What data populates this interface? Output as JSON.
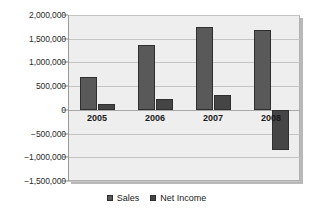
{
  "chart_data": {
    "type": "bar",
    "title": "",
    "xlabel": "",
    "ylabel": "",
    "categories": [
      "2005",
      "2006",
      "2007",
      "2008"
    ],
    "series": [
      {
        "name": "Sales",
        "color": "#595959",
        "values": [
          700000,
          1375000,
          1750000,
          1690000
        ]
      },
      {
        "name": "Net Income",
        "color": "#454545",
        "values": [
          125000,
          225000,
          320000,
          -850000
        ]
      }
    ],
    "ylim": [
      -1500000,
      2000000
    ],
    "ytick_values": [
      2000000,
      1500000,
      1000000,
      500000,
      0,
      -500000,
      -1000000,
      -1500000
    ],
    "ytick_labels": [
      "2,000,000",
      "1,500,000",
      "1,000,000",
      "500,000",
      "0",
      "−500,000",
      "−1,000,000",
      "−1,500,000"
    ],
    "grid": true,
    "legend_position": "bottom",
    "plot_background": "#eeeeee"
  },
  "legend": {
    "items": [
      {
        "label": "Sales"
      },
      {
        "label": "Net Income"
      }
    ]
  }
}
